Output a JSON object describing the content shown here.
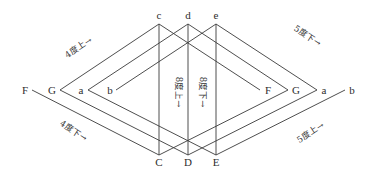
{
  "diagram": {
    "top_labels": [
      "c",
      "d",
      "e"
    ],
    "bottom_labels": [
      "C",
      "D",
      "E"
    ],
    "left_labels": [
      "F",
      "G",
      "a",
      "b"
    ],
    "right_labels": [
      "F",
      "G",
      "a",
      "b"
    ],
    "annotations": {
      "upper_left": "4度上→",
      "upper_right": "5度下→",
      "lower_left": "4度下→",
      "lower_right": "5度上→",
      "center_left_vertical": "8度上→",
      "center_right_vertical": "8度下→"
    }
  },
  "colors": {
    "line": "#3a3a3a",
    "text": "#2e2e2e",
    "background": "#ffffff"
  }
}
